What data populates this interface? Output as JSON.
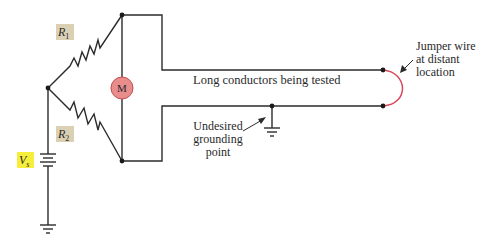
{
  "diagram": {
    "type": "circuit",
    "labels": {
      "r1": "R",
      "r1_sub": "1",
      "r2": "R",
      "r2_sub": "2",
      "vs": "V",
      "vs_sub": "s",
      "motor": "M",
      "conductors": "Long conductors being tested",
      "ground_note": [
        "Undesired",
        "grounding",
        "point"
      ],
      "jumper_note": [
        "Jumper wire",
        "at distant",
        "location"
      ]
    },
    "colors": {
      "wire": "#2b2b2b",
      "jumper": "#d9475a",
      "motor_fill": "#e98c8c",
      "motor_stroke": "#c0504d",
      "resistor_label_bg": "#dcd0b4",
      "vs_label_bg": "#f5ee3a"
    }
  }
}
